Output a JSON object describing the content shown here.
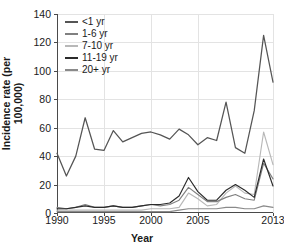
{
  "chart_data": {
    "type": "line",
    "title": "",
    "xlabel": "Year",
    "ylabel": "Incidence rate (per 100,000)",
    "xlim": [
      1990,
      2013
    ],
    "ylim": [
      0,
      140
    ],
    "ytick_labels": [
      "0",
      "20",
      "40",
      "60",
      "80",
      "100",
      "120",
      "140"
    ],
    "ytick_values": [
      0,
      20,
      40,
      60,
      80,
      100,
      120,
      140
    ],
    "xtick_labels": [
      "1990",
      "1995",
      "2000",
      "2005",
      "2013"
    ],
    "xtick_values": [
      1990,
      1995,
      2000,
      2005,
      2013
    ],
    "grid": true,
    "legend_position": "top-left-inside",
    "x": [
      1990,
      1991,
      1992,
      1993,
      1994,
      1995,
      1996,
      1997,
      1998,
      1999,
      2000,
      2001,
      2002,
      2003,
      2004,
      2005,
      2006,
      2007,
      2008,
      2009,
      2010,
      2011,
      2012,
      2013
    ],
    "series": [
      {
        "name": "<1 yr",
        "color": "#555555",
        "values": [
          42,
          26,
          40,
          67,
          45,
          44,
          58,
          50,
          53,
          56,
          57,
          55,
          52,
          59,
          55,
          48,
          53,
          51,
          78,
          46,
          42,
          72,
          125,
          92
        ]
      },
      {
        "name": "1-6 yr",
        "color": "#808080",
        "values": [
          4,
          3,
          4,
          6,
          4,
          4,
          5,
          4,
          4,
          5,
          6,
          5,
          6,
          9,
          18,
          13,
          8,
          8,
          11,
          13,
          10,
          9,
          35,
          24
        ]
      },
      {
        "name": "7-10 yr",
        "color": "#b8b8b8",
        "values": [
          2,
          2,
          2,
          2,
          2,
          2,
          2,
          2,
          2,
          2,
          3,
          3,
          3,
          4,
          14,
          10,
          5,
          6,
          14,
          19,
          14,
          13,
          57,
          34
        ]
      },
      {
        "name": "11-19 yr",
        "color": "#2b2b2b",
        "values": [
          3,
          3,
          4,
          5,
          4,
          4,
          5,
          4,
          4,
          5,
          6,
          6,
          7,
          12,
          25,
          15,
          9,
          9,
          16,
          20,
          16,
          11,
          38,
          19
        ]
      },
      {
        "name": "20+ yr",
        "color": "#8a8a8a",
        "values": [
          1,
          1,
          1,
          1,
          1,
          1,
          1,
          1,
          1,
          1,
          1,
          1,
          1,
          2,
          3,
          3,
          3,
          3,
          4,
          4,
          3,
          3,
          5,
          4
        ]
      }
    ]
  }
}
